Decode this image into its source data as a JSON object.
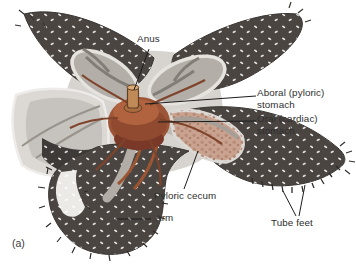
{
  "figure": {
    "panel": "(a)"
  },
  "labels": {
    "anus": "Anus",
    "aboral_stomach": "Aboral (pyloric)\nstomach",
    "oral_stomach": "Oral (cardiac)\nstomach",
    "pyloric_cecum": "Pyloric cecum",
    "arm": "Arm",
    "tube_feet": "Tube feet"
  },
  "colors": {
    "background": "#ffffff",
    "arm_body": "#4b4542",
    "arm_speckle": "#ffffff",
    "disc_interior": "#d7d4d0",
    "cut_rim": "#e6e3df",
    "cut_opening": "#b3aea8",
    "stomach": "#9c5536",
    "stomach_shadow": "#7a3928",
    "stomach_highlight": "#b1633f",
    "pyloric_cecum_fill": "#c9a390",
    "orange_duct": "#9c5431",
    "leader_line": "#1c1c1c",
    "label_text": "#2e2e2e"
  }
}
